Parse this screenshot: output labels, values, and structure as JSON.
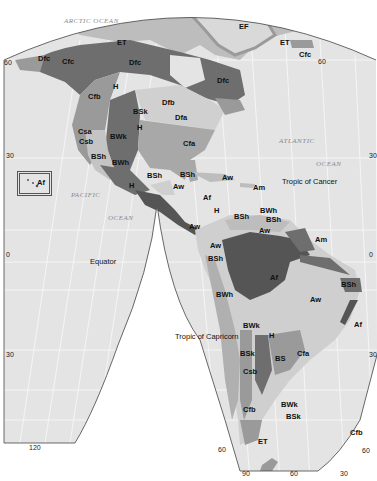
{
  "map": {
    "title": "Köppen Climate Classification – The Americas",
    "colors": {
      "ocean": "#e4e4e4",
      "graticule": "#f6f6f6",
      "outside": "#ffffff",
      "tundra_ice": "#bdbdbd",
      "dark_continental": "#6e6e6e",
      "mid": "#9a9a9a",
      "light_land": "#cfcfcf",
      "very_dark": "#555555"
    },
    "oceans": [
      {
        "id": "arctic",
        "label": "ARCTIC OCEAN"
      },
      {
        "id": "atlantic",
        "label": "ATLANTIC"
      },
      {
        "id": "atlantic2",
        "label": "OCEAN"
      },
      {
        "id": "pacific",
        "label": "PACIFIC"
      },
      {
        "id": "pacific2",
        "label": "OCEAN"
      }
    ],
    "reference_lines": [
      {
        "id": "cancer",
        "label": "Tropic of Cancer"
      },
      {
        "id": "equator",
        "label": "Equator"
      },
      {
        "id": "capricorn",
        "label": "Tropic of Capricorn"
      }
    ],
    "degree_labels": [
      {
        "id": "lat60-w",
        "label": "60"
      },
      {
        "id": "lat60-e",
        "label": "60"
      },
      {
        "id": "lat30-w",
        "label": "30"
      },
      {
        "id": "lat30-e",
        "label": "30"
      },
      {
        "id": "lat0-w",
        "label": "0"
      },
      {
        "id": "lat0-e",
        "label": "0"
      },
      {
        "id": "lat30s-w",
        "label": "30"
      },
      {
        "id": "lat30s-e",
        "label": "30"
      },
      {
        "id": "lat60s-w",
        "label": "60"
      },
      {
        "id": "lat60s-e",
        "label": "60"
      },
      {
        "id": "lon120",
        "label": "120"
      },
      {
        "id": "lon90",
        "label": "90"
      },
      {
        "id": "lon60",
        "label": "60"
      },
      {
        "id": "lon30",
        "label": "30"
      }
    ],
    "climate_labels": [
      {
        "id": "ET-n",
        "label": "ET"
      },
      {
        "id": "EF",
        "label": "EF"
      },
      {
        "id": "ET-gl",
        "label": "ET"
      },
      {
        "id": "Cfc-ic",
        "label": "Cfc"
      },
      {
        "id": "Dfc-ak",
        "label": "Dfc"
      },
      {
        "id": "Cfc-ak",
        "label": "Cfc"
      },
      {
        "id": "Dfc-ca",
        "label": "Dfc"
      },
      {
        "id": "Dfc-qc",
        "label": "Dfc"
      },
      {
        "id": "Cfb-nw",
        "label": "Cfb"
      },
      {
        "id": "H-rk",
        "label": "H"
      },
      {
        "id": "Dfb",
        "label": "Dfb"
      },
      {
        "id": "BSk-gp",
        "label": "BSk"
      },
      {
        "id": "Dfa",
        "label": "Dfa"
      },
      {
        "id": "H-rk2",
        "label": "H"
      },
      {
        "id": "Csa",
        "label": "Csa"
      },
      {
        "id": "Csb",
        "label": "Csb"
      },
      {
        "id": "BWk-gb",
        "label": "BWk"
      },
      {
        "id": "Cfa-se",
        "label": "Cfa"
      },
      {
        "id": "BSh-ca",
        "label": "BSh"
      },
      {
        "id": "BWh-sw",
        "label": "BWh"
      },
      {
        "id": "BSh-mx",
        "label": "BSh"
      },
      {
        "id": "BSh-yc",
        "label": "BSh"
      },
      {
        "id": "H-mx",
        "label": "H"
      },
      {
        "id": "Aw-mx",
        "label": "Aw"
      },
      {
        "id": "Af-hi",
        "label": "Af"
      },
      {
        "id": "Aw-cu",
        "label": "Aw"
      },
      {
        "id": "Am-car",
        "label": "Am"
      },
      {
        "id": "Af-ca",
        "label": "Af"
      },
      {
        "id": "H-ca",
        "label": "H"
      },
      {
        "id": "Aw-ca",
        "label": "Aw"
      },
      {
        "id": "BSh-ve",
        "label": "BSh"
      },
      {
        "id": "BWh-ve",
        "label": "BWh"
      },
      {
        "id": "BSh-ve2",
        "label": "BSh"
      },
      {
        "id": "Aw-ve",
        "label": "Aw"
      },
      {
        "id": "Aw-co",
        "label": "Aw"
      },
      {
        "id": "Am-br",
        "label": "Am"
      },
      {
        "id": "BSh-ec",
        "label": "BSh"
      },
      {
        "id": "Af-am",
        "label": "Af"
      },
      {
        "id": "BSh-ne",
        "label": "BSh"
      },
      {
        "id": "BWh-pe",
        "label": "BWh"
      },
      {
        "id": "Aw-br",
        "label": "Aw"
      },
      {
        "id": "Af-br",
        "label": "Af"
      },
      {
        "id": "BWk-an",
        "label": "BWk"
      },
      {
        "id": "H-an",
        "label": "H"
      },
      {
        "id": "BSk-ch",
        "label": "BSk"
      },
      {
        "id": "BS-ar",
        "label": "BS"
      },
      {
        "id": "Cfa-ar",
        "label": "Cfa"
      },
      {
        "id": "Csb-ch",
        "label": "Csb"
      },
      {
        "id": "Cfb-ch",
        "label": "Cfb"
      },
      {
        "id": "BWk-pt",
        "label": "BWk"
      },
      {
        "id": "BSk-pt",
        "label": "BSk"
      },
      {
        "id": "ET-tf",
        "label": "ET"
      },
      {
        "id": "Cfb-fk",
        "label": "Cfb"
      }
    ]
  }
}
